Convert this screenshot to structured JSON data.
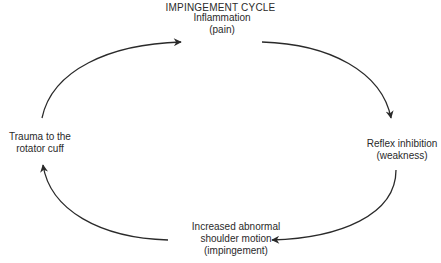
{
  "diagram": {
    "title": "IMPINGEMENT CYCLE",
    "type": "cycle",
    "direction": "clockwise",
    "nodes": [
      {
        "id": "inflammation",
        "lines": [
          "Inflammation",
          "(pain)"
        ],
        "position": "top"
      },
      {
        "id": "reflex",
        "lines": [
          "Reflex inhibition",
          "(weakness)"
        ],
        "position": "right"
      },
      {
        "id": "motion",
        "lines": [
          "Increased abnormal",
          "shoulder motion",
          "(impingement)"
        ],
        "position": "bottom"
      },
      {
        "id": "trauma",
        "lines": [
          "Trauma to the",
          "rotator cuff"
        ],
        "position": "left"
      }
    ],
    "edges": [
      {
        "from": "trauma",
        "to": "inflammation"
      },
      {
        "from": "inflammation",
        "to": "reflex"
      },
      {
        "from": "reflex",
        "to": "motion"
      },
      {
        "from": "motion",
        "to": "trauma"
      }
    ],
    "colors": {
      "stroke": "#2a2a2a",
      "text": "#2a2a2a",
      "background": "#ffffff"
    }
  }
}
